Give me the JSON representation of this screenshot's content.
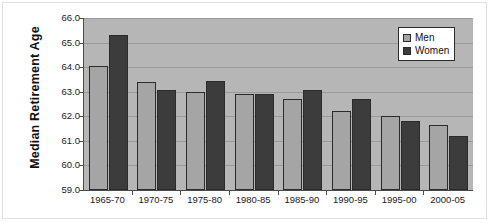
{
  "chart_data": {
    "type": "bar",
    "title": "",
    "subtitle": "",
    "xlabel": "",
    "ylabel": "Median Retirement Age",
    "categories": [
      "1965-70",
      "1970-75",
      "1975-80",
      "1980-85",
      "1985-90",
      "1990-95",
      "1995-00",
      "2000-05"
    ],
    "series": [
      {
        "name": "Men",
        "color": "#a5a5a5",
        "values": [
          64.05,
          63.4,
          63.0,
          62.9,
          62.7,
          62.2,
          62.0,
          61.65
        ]
      },
      {
        "name": "Women",
        "color": "#3c3c3c",
        "values": [
          65.3,
          63.05,
          63.45,
          62.9,
          63.05,
          62.7,
          61.8,
          61.2
        ]
      }
    ],
    "ylim": [
      59.0,
      66.0
    ],
    "ytick_labels": [
      "66.0",
      "65.0",
      "64.0",
      "63.0",
      "62.0",
      "61.0",
      "60.0",
      "59.0"
    ],
    "ytick_values": [
      66.0,
      65.0,
      64.0,
      63.0,
      62.0,
      61.0,
      60.0,
      59.0
    ],
    "grid": true,
    "grid_axis": "y",
    "legend_position": "top-right",
    "plot_background": "#b6b6b6",
    "figure_background": "#ffffff",
    "axis_color": "#4a4a4a",
    "gridline_color": "#9a9a9a",
    "bar_border_color": "#2b2b2b"
  },
  "legend": {
    "entries": [
      {
        "label": "Men",
        "swatch_class": "men"
      },
      {
        "label": "Women",
        "swatch_class": "women"
      }
    ]
  },
  "axis": {
    "y_title": "Median Retirement Age"
  }
}
